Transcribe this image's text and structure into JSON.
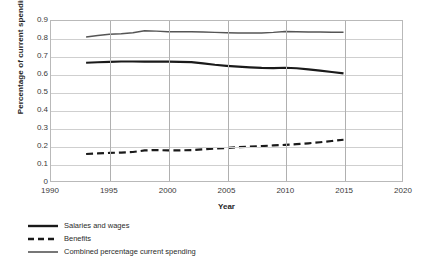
{
  "chart_data": {
    "type": "line",
    "title": "",
    "xlabel": "Year",
    "ylabel": "Percentage of current spending",
    "xlim": [
      1990,
      2020
    ],
    "ylim": [
      0,
      0.9
    ],
    "grid": true,
    "legend_position": "bottom-left",
    "x_ticks": [
      "1990",
      "1995",
      "2000",
      "2005",
      "2010",
      "2015",
      "2020"
    ],
    "y_ticks": [
      "0",
      "0.1",
      "0.2",
      "0.3",
      "0.4",
      "0.5",
      "0.6",
      "0.7",
      "0.8",
      "0.9"
    ],
    "x": [
      1993,
      1994,
      1995,
      1996,
      1997,
      1998,
      1999,
      2000,
      2001,
      2002,
      2003,
      2004,
      2005,
      2006,
      2007,
      2008,
      2009,
      2010,
      2011,
      2012,
      2013,
      2014,
      2015
    ],
    "series": [
      {
        "name": "Salaries and wages",
        "style": "solid-thick",
        "color": "#1a1a1a",
        "values": [
          0.665,
          0.668,
          0.67,
          0.672,
          0.672,
          0.671,
          0.671,
          0.671,
          0.67,
          0.669,
          0.662,
          0.654,
          0.648,
          0.643,
          0.639,
          0.636,
          0.635,
          0.637,
          0.634,
          0.628,
          0.621,
          0.613,
          0.605
        ]
      },
      {
        "name": "Benefits",
        "style": "dashed",
        "color": "#1a1a1a",
        "values": [
          0.152,
          0.155,
          0.158,
          0.16,
          0.163,
          0.172,
          0.174,
          0.172,
          0.172,
          0.174,
          0.178,
          0.182,
          0.186,
          0.19,
          0.193,
          0.196,
          0.2,
          0.203,
          0.207,
          0.212,
          0.218,
          0.225,
          0.232
        ]
      },
      {
        "name": "Combined percentage current spending",
        "style": "solid-thin",
        "color": "#555555",
        "values": [
          0.81,
          0.818,
          0.825,
          0.828,
          0.834,
          0.845,
          0.843,
          0.84,
          0.839,
          0.839,
          0.838,
          0.836,
          0.834,
          0.833,
          0.832,
          0.833,
          0.836,
          0.841,
          0.84,
          0.838,
          0.838,
          0.837,
          0.837
        ]
      }
    ]
  },
  "legend": {
    "items": [
      {
        "label": "Salaries and wages",
        "swatch": "solid-thick-line-icon"
      },
      {
        "label": "Benefits",
        "swatch": "dashed-line-icon"
      },
      {
        "label": "Combined percentage current spending",
        "swatch": "solid-thin-line-icon"
      }
    ]
  }
}
